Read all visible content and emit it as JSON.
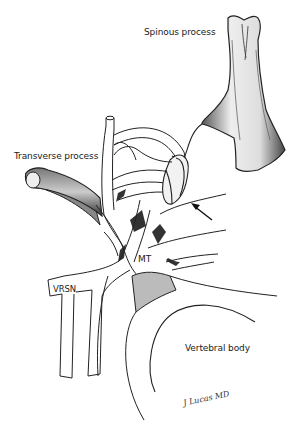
{
  "figure": {
    "type": "anatomical illustration",
    "colors": {
      "ink": "#222222",
      "shade": "#555555",
      "background": "#ffffff"
    }
  },
  "labels": {
    "spinous_process": "Spinous process",
    "transverse_process": "Transverse process",
    "mt": "MT",
    "vrsn": "VRSN",
    "vertebral_body": "Vertebral body"
  },
  "annotations": {
    "arrow": "arrow-pointing-to-ligament",
    "signature": "J Lucas MD"
  }
}
